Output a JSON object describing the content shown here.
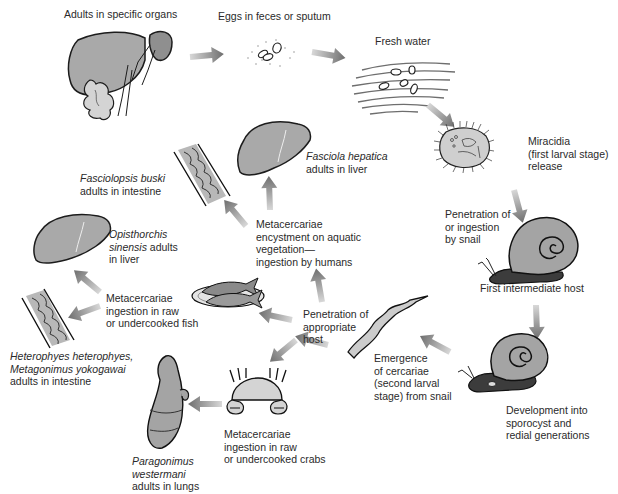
{
  "diagram": {
    "type": "life-cycle",
    "colors": {
      "organ_fill": "#a9a9a9",
      "organ_stroke": "#1c1c1c",
      "arrow": "#7d7d7d",
      "snail_shell": "#a4a4a4",
      "snail_body": "#3c3c3c",
      "background": "#ffffff",
      "text": "#2a2a2a"
    },
    "stages": [
      {
        "id": "adults",
        "label": "Adults in specific organs"
      },
      {
        "id": "eggs",
        "label": "Eggs in feces or sputum"
      },
      {
        "id": "water",
        "label": "Fresh water"
      },
      {
        "id": "miracidia",
        "lines": [
          "Miracidia",
          "(first larval stage)",
          "release"
        ]
      },
      {
        "id": "snail-penetration",
        "lines": [
          "Penetration of",
          "or ingestion",
          "by snail"
        ]
      },
      {
        "id": "first-host",
        "label": "First intermediate host"
      },
      {
        "id": "development",
        "lines": [
          "Development into",
          "sporocyst and",
          "redial generations"
        ]
      },
      {
        "id": "cercariae",
        "lines": [
          "Emergence",
          "of cercariae",
          "(second larval",
          "stage) from snail"
        ]
      },
      {
        "id": "host-penetration",
        "lines": [
          "Penetration of",
          "appropriate",
          "host"
        ]
      },
      {
        "id": "vegetation",
        "lines": [
          "Metacercariae",
          "encystment on aquatic",
          "vegetation—",
          "ingestion by humans"
        ]
      },
      {
        "id": "fish",
        "lines": [
          "Metacercariae",
          "ingestion in raw",
          "or undercooked fish"
        ]
      },
      {
        "id": "crabs",
        "lines": [
          "Metacercariae",
          "ingestion in raw",
          "or undercooked crabs"
        ]
      }
    ],
    "species": {
      "fasciola": {
        "name": "Fasciola hepatica",
        "rest": "adults in liver"
      },
      "fasciolopsis": {
        "name": "Fasciolopsis buski",
        "rest": "adults in intestine"
      },
      "opisthorchis": {
        "name_1": "Opisthorchis",
        "name_2": "sinensis",
        "rest_1": " adults",
        "rest_2": "in liver"
      },
      "heterophyes": {
        "name_1": "Heterophyes heterophyes,",
        "name_2": "Metagonimus yokogawai",
        "rest": "adults in intestine"
      },
      "paragonimus": {
        "name_1": "Paragonimus",
        "name_2": "westermani",
        "rest": "adults in lungs"
      }
    }
  }
}
